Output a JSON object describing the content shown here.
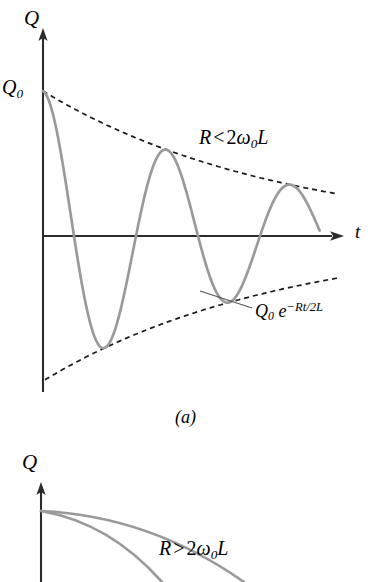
{
  "figure": {
    "background_color": "#ffffff",
    "curve_color": "#9a9a9a",
    "axis_color": "#2b2b2b",
    "dash_color": "#1a1a1a",
    "leader_color": "#555555",
    "panel_a_caption": "(a)"
  },
  "panel_a": {
    "name": "underdamped-lc-oscillation",
    "y_axis_label": "Q",
    "x_axis_label": "t",
    "initial_value_label": "Q",
    "initial_value_subscript": "0",
    "condition_label": {
      "lhs": "R",
      "operator": "<",
      "factor": "2",
      "omega": "ω",
      "omega_subscript": "0",
      "inductance": "L"
    },
    "envelope_label": {
      "amplitude": "Q",
      "amplitude_subscript": "0",
      "exponential_base": "e",
      "exponent": "−Rt/2L"
    },
    "geometry": {
      "origin_x": 43,
      "t_axis_y": 236,
      "y_axis_top": 30,
      "y_axis_bottom": 392,
      "t_axis_right": 341,
      "q0_y": 91,
      "curve_start_x": 43,
      "curve_end_x": 320,
      "amplitude_initial": 145,
      "decay_constant": 0.0042,
      "half_period": 62,
      "first_trough_x": 72,
      "peaks_x": [
        103,
        165,
        228,
        290
      ],
      "troughs_x": [
        72,
        135,
        196,
        257,
        318
      ],
      "envelope_right_x": 337,
      "envelope_lower_left_x": 45,
      "dash_pattern": "5 4"
    }
  },
  "panel_b": {
    "name": "overdamped-lc-decay",
    "y_axis_label": "Q",
    "condition_label": {
      "lhs": "R",
      "operator": ">",
      "factor": "2",
      "omega": "ω",
      "omega_subscript": "0",
      "inductance": "L"
    },
    "geometry": {
      "origin_x": 41,
      "y_axis_top": 484,
      "y_axis_bottom": 582,
      "curve_start_y": 511,
      "curve_slow": "M 41 511 Q 150 516 244 582",
      "curve_fast": "M 41 511 Q 110 523 162 582"
    }
  },
  "chart_data": {
    "type": "line",
    "title": "",
    "xlabel": "t",
    "ylabel": "Q",
    "panels": [
      {
        "label": "(a)",
        "regime": "underdamped",
        "annotation": "R < 2ω0L",
        "envelope_equation": "Q0 e^(−Rt/2L)",
        "series": [
          {
            "name": "charge-oscillation",
            "description": "Q(t) = Q0 e^(−Rt/2L) cos(ωt)",
            "color": "#9a9a9a",
            "style": "solid"
          },
          {
            "name": "upper-envelope",
            "description": "+Q0 e^(−Rt/2L)",
            "color": "#1a1a1a",
            "style": "dashed"
          },
          {
            "name": "lower-envelope",
            "description": "−Q0 e^(−Rt/2L)",
            "color": "#1a1a1a",
            "style": "dashed"
          }
        ],
        "peak_amplitudes_relative": [
          1.0,
          0.78,
          0.61,
          0.48,
          0.38
        ],
        "trough_amplitudes_relative": [
          -0.88,
          -0.69,
          -0.54,
          -0.42,
          -0.33
        ],
        "cycles_shown": 4.5,
        "grid": false,
        "legend": false
      },
      {
        "label": "(b)",
        "regime": "overdamped",
        "annotation": "R > 2ω0L",
        "series": [
          {
            "name": "slow-decay-curve",
            "description": "smaller damping constant, slower monotonic decay",
            "color": "#9a9a9a",
            "style": "solid"
          },
          {
            "name": "fast-decay-curve",
            "description": "larger damping constant, faster monotonic decay",
            "color": "#9a9a9a",
            "style": "solid"
          }
        ],
        "grid": false,
        "legend": false
      }
    ]
  }
}
